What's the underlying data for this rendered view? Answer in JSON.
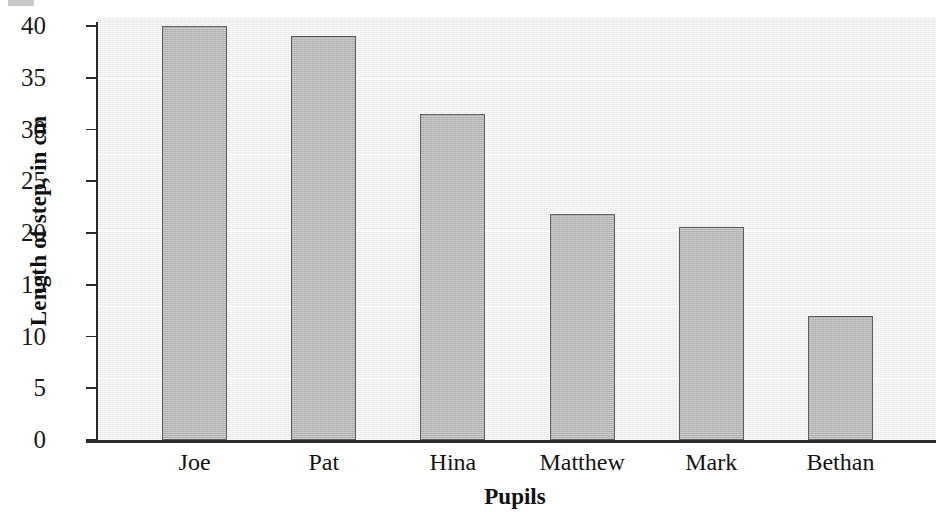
{
  "chart_data": {
    "type": "bar",
    "title": "",
    "xlabel": "Pupils",
    "ylabel": "Length of step, in cm",
    "categories": [
      "Joe",
      "Pat",
      "Hina",
      "Matthew",
      "Mark",
      "Bethan"
    ],
    "values": [
      40,
      39,
      31.5,
      21.8,
      20.6,
      12
    ],
    "ylim": [
      0,
      40
    ],
    "ytick_labels": [
      "40",
      "35",
      "30",
      "25",
      "20",
      "15",
      "10",
      "5",
      "0"
    ],
    "ytick_values": [
      40,
      35,
      30,
      25,
      20,
      15,
      10,
      5,
      0
    ],
    "ytick_step": 5,
    "grid": false,
    "legend": false,
    "legend_position": "none",
    "bar_fill_color": "#b9b9b9",
    "bar_border_color": "#5e5e5e",
    "plot_background_color": "#e9e9e9",
    "axis_color": "#2b2b2b",
    "text_color": "#1a1a1a"
  }
}
